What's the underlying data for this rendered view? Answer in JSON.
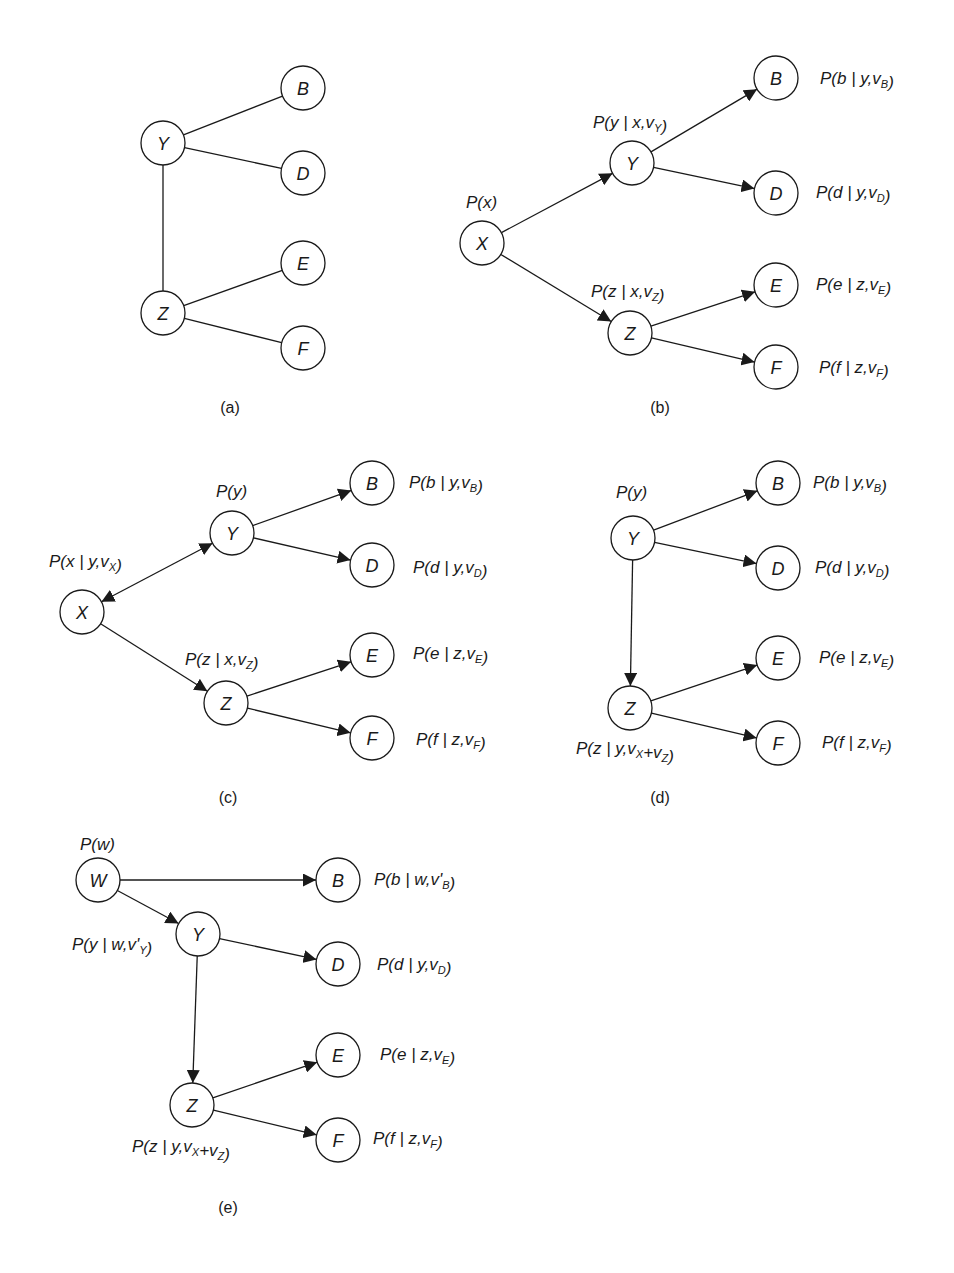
{
  "figure": {
    "style": {
      "stroke_color": "#1a1a1a",
      "background": "#ffffff",
      "node_radius": 22
    },
    "panels": [
      {
        "id": "a",
        "caption": "(a)",
        "caption_pos": [
          230,
          408
        ],
        "directed": false,
        "nodes": [
          {
            "id": "Y",
            "label": "Y",
            "x": 163,
            "y": 143
          },
          {
            "id": "B",
            "label": "B",
            "x": 303,
            "y": 88
          },
          {
            "id": "D",
            "label": "D",
            "x": 303,
            "y": 173
          },
          {
            "id": "Z",
            "label": "Z",
            "x": 163,
            "y": 313
          },
          {
            "id": "E",
            "label": "E",
            "x": 303,
            "y": 263
          },
          {
            "id": "F",
            "label": "F",
            "x": 303,
            "y": 348
          }
        ],
        "edges": [
          {
            "from": "Y",
            "to": "B",
            "arrow": "none"
          },
          {
            "from": "Y",
            "to": "D",
            "arrow": "none"
          },
          {
            "from": "Y",
            "to": "Z",
            "arrow": "none"
          },
          {
            "from": "Z",
            "to": "E",
            "arrow": "none"
          },
          {
            "from": "Z",
            "to": "F",
            "arrow": "none"
          }
        ],
        "probabilities": []
      },
      {
        "id": "b",
        "caption": "(b)",
        "caption_pos": [
          660,
          408
        ],
        "directed": true,
        "nodes": [
          {
            "id": "X",
            "label": "X",
            "x": 482,
            "y": 243
          },
          {
            "id": "Y",
            "label": "Y",
            "x": 632,
            "y": 163
          },
          {
            "id": "B",
            "label": "B",
            "x": 776,
            "y": 78
          },
          {
            "id": "D",
            "label": "D",
            "x": 776,
            "y": 193
          },
          {
            "id": "Z",
            "label": "Z",
            "x": 630,
            "y": 333
          },
          {
            "id": "E",
            "label": "E",
            "x": 776,
            "y": 285
          },
          {
            "id": "F",
            "label": "F",
            "x": 776,
            "y": 367
          }
        ],
        "edges": [
          {
            "from": "X",
            "to": "Y",
            "arrow": "end"
          },
          {
            "from": "X",
            "to": "Z",
            "arrow": "end"
          },
          {
            "from": "Y",
            "to": "B",
            "arrow": "end"
          },
          {
            "from": "Y",
            "to": "D",
            "arrow": "end"
          },
          {
            "from": "Z",
            "to": "E",
            "arrow": "end"
          },
          {
            "from": "Z",
            "to": "F",
            "arrow": "end"
          }
        ],
        "probabilities": [
          {
            "node": "X",
            "text": "P(x)",
            "x": 466,
            "y": 208,
            "parts": [
              {
                "t": "P(x)"
              }
            ]
          },
          {
            "node": "Y",
            "text": "P(y | x,v_Y)",
            "x": 593,
            "y": 128,
            "parts": [
              {
                "t": "P(y | x,v"
              },
              {
                "t": "Y",
                "sub": true
              },
              {
                "t": ")"
              }
            ]
          },
          {
            "node": "B",
            "text": "P(b | y,v_B)",
            "x": 820,
            "y": 84,
            "parts": [
              {
                "t": "P(b | y,v"
              },
              {
                "t": "B",
                "sub": true
              },
              {
                "t": ")"
              }
            ]
          },
          {
            "node": "D",
            "text": "P(d | y,v_D)",
            "x": 816,
            "y": 198,
            "parts": [
              {
                "t": "P(d | y,v"
              },
              {
                "t": "D",
                "sub": true
              },
              {
                "t": ")"
              }
            ]
          },
          {
            "node": "Z",
            "text": "P(z | x,v_Z)",
            "x": 591,
            "y": 297,
            "parts": [
              {
                "t": "P(z | x,v"
              },
              {
                "t": "Z",
                "sub": true
              },
              {
                "t": ")"
              }
            ]
          },
          {
            "node": "E",
            "text": "P(e | z,v_E)",
            "x": 816,
            "y": 290,
            "parts": [
              {
                "t": "P(e | z,v"
              },
              {
                "t": "E",
                "sub": true
              },
              {
                "t": ")"
              }
            ]
          },
          {
            "node": "F",
            "text": "P(f | z,v_F)",
            "x": 819,
            "y": 373,
            "parts": [
              {
                "t": "P(f | z,v"
              },
              {
                "t": "F",
                "sub": true
              },
              {
                "t": ")"
              }
            ]
          }
        ]
      },
      {
        "id": "c",
        "caption": "(c)",
        "caption_pos": [
          228,
          798
        ],
        "directed": true,
        "nodes": [
          {
            "id": "X",
            "label": "X",
            "x": 82,
            "y": 612
          },
          {
            "id": "Y",
            "label": "Y",
            "x": 232,
            "y": 533
          },
          {
            "id": "B",
            "label": "B",
            "x": 372,
            "y": 483
          },
          {
            "id": "D",
            "label": "D",
            "x": 372,
            "y": 565
          },
          {
            "id": "Z",
            "label": "Z",
            "x": 226,
            "y": 703
          },
          {
            "id": "E",
            "label": "E",
            "x": 372,
            "y": 655
          },
          {
            "id": "F",
            "label": "F",
            "x": 372,
            "y": 738
          }
        ],
        "edges": [
          {
            "from": "X",
            "to": "Y",
            "arrow": "both"
          },
          {
            "from": "X",
            "to": "Z",
            "arrow": "end"
          },
          {
            "from": "Y",
            "to": "B",
            "arrow": "end"
          },
          {
            "from": "Y",
            "to": "D",
            "arrow": "end"
          },
          {
            "from": "Z",
            "to": "E",
            "arrow": "end"
          },
          {
            "from": "Z",
            "to": "F",
            "arrow": "end"
          }
        ],
        "probabilities": [
          {
            "node": "X",
            "text": "P(x | y,v_X)",
            "x": 49,
            "y": 567,
            "parts": [
              {
                "t": "P(x | y,v"
              },
              {
                "t": "X",
                "sub": true
              },
              {
                "t": ")"
              }
            ]
          },
          {
            "node": "Y",
            "text": "P(y)",
            "x": 216,
            "y": 497,
            "parts": [
              {
                "t": "P(y)"
              }
            ]
          },
          {
            "node": "B",
            "text": "P(b | y,v_B)",
            "x": 409,
            "y": 488,
            "parts": [
              {
                "t": "P(b | y,v"
              },
              {
                "t": "B",
                "sub": true
              },
              {
                "t": ")"
              }
            ]
          },
          {
            "node": "D",
            "text": "P(d | y,v_D)",
            "x": 413,
            "y": 573,
            "parts": [
              {
                "t": "P(d | y,v"
              },
              {
                "t": "D",
                "sub": true
              },
              {
                "t": ")"
              }
            ]
          },
          {
            "node": "Z",
            "text": "P(z | x,v_Z)",
            "x": 185,
            "y": 665,
            "parts": [
              {
                "t": "P(z | x,v"
              },
              {
                "t": "Z",
                "sub": true
              },
              {
                "t": ")"
              }
            ]
          },
          {
            "node": "E",
            "text": "P(e | z,v_E)",
            "x": 413,
            "y": 659,
            "parts": [
              {
                "t": "P(e | z,v"
              },
              {
                "t": "E",
                "sub": true
              },
              {
                "t": ")"
              }
            ]
          },
          {
            "node": "F",
            "text": "P(f | z,v_F)",
            "x": 416,
            "y": 745,
            "parts": [
              {
                "t": "P(f | z,v"
              },
              {
                "t": "F",
                "sub": true
              },
              {
                "t": ")"
              }
            ]
          }
        ]
      },
      {
        "id": "d",
        "caption": "(d)",
        "caption_pos": [
          660,
          798
        ],
        "directed": true,
        "nodes": [
          {
            "id": "Y",
            "label": "Y",
            "x": 633,
            "y": 538
          },
          {
            "id": "B",
            "label": "B",
            "x": 778,
            "y": 483
          },
          {
            "id": "D",
            "label": "D",
            "x": 778,
            "y": 568
          },
          {
            "id": "Z",
            "label": "Z",
            "x": 630,
            "y": 708
          },
          {
            "id": "E",
            "label": "E",
            "x": 778,
            "y": 658
          },
          {
            "id": "F",
            "label": "F",
            "x": 778,
            "y": 743
          }
        ],
        "edges": [
          {
            "from": "Y",
            "to": "Z",
            "arrow": "end"
          },
          {
            "from": "Y",
            "to": "B",
            "arrow": "end"
          },
          {
            "from": "Y",
            "to": "D",
            "arrow": "end"
          },
          {
            "from": "Z",
            "to": "E",
            "arrow": "end"
          },
          {
            "from": "Z",
            "to": "F",
            "arrow": "end"
          }
        ],
        "probabilities": [
          {
            "node": "Y",
            "text": "P(y)",
            "x": 616,
            "y": 498,
            "parts": [
              {
                "t": "P(y)"
              }
            ]
          },
          {
            "node": "B",
            "text": "P(b | y,v_B)",
            "x": 813,
            "y": 488,
            "parts": [
              {
                "t": "P(b | y,v"
              },
              {
                "t": "B",
                "sub": true
              },
              {
                "t": ")"
              }
            ]
          },
          {
            "node": "D",
            "text": "P(d | y,v_D)",
            "x": 815,
            "y": 573,
            "parts": [
              {
                "t": "P(d | y,v"
              },
              {
                "t": "D",
                "sub": true
              },
              {
                "t": ")"
              }
            ]
          },
          {
            "node": "Z",
            "text": "P(z | y,v_X+v_Z)",
            "x": 576,
            "y": 754,
            "parts": [
              {
                "t": "P(z | y,v"
              },
              {
                "t": "X",
                "sub": true
              },
              {
                "t": "+v"
              },
              {
                "t": "Z",
                "sub": true
              },
              {
                "t": ")"
              }
            ]
          },
          {
            "node": "E",
            "text": "P(e | z,v_E)",
            "x": 819,
            "y": 663,
            "parts": [
              {
                "t": "P(e | z,v"
              },
              {
                "t": "E",
                "sub": true
              },
              {
                "t": ")"
              }
            ]
          },
          {
            "node": "F",
            "text": "P(f | z,v_F)",
            "x": 822,
            "y": 748,
            "parts": [
              {
                "t": "P(f | z,v"
              },
              {
                "t": "F",
                "sub": true
              },
              {
                "t": ")"
              }
            ]
          }
        ]
      },
      {
        "id": "e",
        "caption": "(e)",
        "caption_pos": [
          228,
          1208
        ],
        "directed": true,
        "nodes": [
          {
            "id": "W",
            "label": "W",
            "x": 98,
            "y": 880
          },
          {
            "id": "B",
            "label": "B",
            "x": 338,
            "y": 880
          },
          {
            "id": "Y",
            "label": "Y",
            "x": 198,
            "y": 934
          },
          {
            "id": "D",
            "label": "D",
            "x": 338,
            "y": 964
          },
          {
            "id": "Z",
            "label": "Z",
            "x": 192,
            "y": 1105
          },
          {
            "id": "E",
            "label": "E",
            "x": 338,
            "y": 1055
          },
          {
            "id": "F",
            "label": "F",
            "x": 338,
            "y": 1140
          }
        ],
        "edges": [
          {
            "from": "W",
            "to": "B",
            "arrow": "end"
          },
          {
            "from": "W",
            "to": "Y",
            "arrow": "end"
          },
          {
            "from": "Y",
            "to": "D",
            "arrow": "end"
          },
          {
            "from": "Y",
            "to": "Z",
            "arrow": "end"
          },
          {
            "from": "Z",
            "to": "E",
            "arrow": "end"
          },
          {
            "from": "Z",
            "to": "F",
            "arrow": "end"
          }
        ],
        "probabilities": [
          {
            "node": "W",
            "text": "P(w)",
            "x": 80,
            "y": 850,
            "parts": [
              {
                "t": "P(w)"
              }
            ]
          },
          {
            "node": "B",
            "text": "P(b | w,v'_B)",
            "x": 374,
            "y": 885,
            "parts": [
              {
                "t": "P(b | w,v'"
              },
              {
                "t": "B",
                "sub": true
              },
              {
                "t": ")"
              }
            ]
          },
          {
            "node": "Y",
            "text": "P(y | w,v'_Y)",
            "x": 72,
            "y": 950,
            "parts": [
              {
                "t": "P(y | w,v'"
              },
              {
                "t": "Y",
                "sub": true
              },
              {
                "t": ")"
              }
            ]
          },
          {
            "node": "D",
            "text": "P(d | y,v_D)",
            "x": 377,
            "y": 970,
            "parts": [
              {
                "t": "P(d | y,v"
              },
              {
                "t": "D",
                "sub": true
              },
              {
                "t": ")"
              }
            ]
          },
          {
            "node": "Z",
            "text": "P(z | y,v_X+v_Z)",
            "x": 132,
            "y": 1152,
            "parts": [
              {
                "t": "P(z | y,v"
              },
              {
                "t": "X",
                "sub": true
              },
              {
                "t": "+v"
              },
              {
                "t": "Z",
                "sub": true
              },
              {
                "t": ")"
              }
            ]
          },
          {
            "node": "E",
            "text": "P(e | z,v_E)",
            "x": 380,
            "y": 1060,
            "parts": [
              {
                "t": "P(e | z,v"
              },
              {
                "t": "E",
                "sub": true
              },
              {
                "t": ")"
              }
            ]
          },
          {
            "node": "F",
            "text": "P(f | z,v_F)",
            "x": 373,
            "y": 1144,
            "parts": [
              {
                "t": "P(f | z,v"
              },
              {
                "t": "F",
                "sub": true
              },
              {
                "t": ")"
              }
            ]
          }
        ]
      }
    ]
  }
}
